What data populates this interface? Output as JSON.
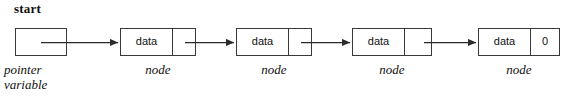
{
  "diagram": {
    "title_label": "start",
    "pointer_variable": {
      "caption": "pointer\nvariable",
      "value": ""
    },
    "nodes": [
      {
        "data_label": "data",
        "link_label": "",
        "caption": "node"
      },
      {
        "data_label": "data",
        "link_label": "",
        "caption": "node"
      },
      {
        "data_label": "data",
        "link_label": "",
        "caption": "node"
      },
      {
        "data_label": "data",
        "link_label": "0",
        "caption": "node"
      }
    ],
    "colors": {
      "stroke": "#3a3a3a",
      "text": "#111111",
      "background": "#ffffff"
    }
  }
}
